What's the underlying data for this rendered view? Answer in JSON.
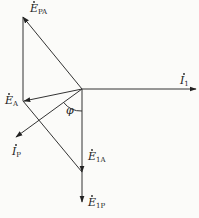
{
  "diagram": {
    "type": "phasor-diagram",
    "origin": {
      "x": 82,
      "y": 89
    },
    "colors": {
      "line": "#333333",
      "text": "#222222",
      "background": "#fbfbf9"
    },
    "vectors": [
      {
        "id": "E_PA",
        "label_main": "E",
        "label_sub": "PA",
        "dot": true,
        "from": [
          82,
          89
        ],
        "to": [
          23,
          17
        ],
        "label_pos": [
          30,
          12
        ]
      },
      {
        "id": "E_A",
        "label_main": "E",
        "label_sub": "A",
        "dot": true,
        "from": [
          82,
          89
        ],
        "to": [
          24,
          101
        ],
        "label_pos": [
          5,
          104
        ]
      },
      {
        "id": "I_1",
        "label_main": "I",
        "label_sub": "1",
        "dot": true,
        "from": [
          82,
          89
        ],
        "to": [
          196,
          89
        ],
        "label_pos": [
          180,
          84
        ]
      },
      {
        "id": "I_P",
        "label_main": "I",
        "label_sub": "P",
        "dot": true,
        "from": [
          82,
          89
        ],
        "to": [
          16,
          137
        ],
        "label_pos": [
          12,
          155
        ]
      },
      {
        "id": "E_1A",
        "label_main": "E",
        "label_sub": "1A",
        "dot": true,
        "from": [
          82,
          89
        ],
        "to": [
          82,
          172
        ],
        "label_pos": [
          88,
          160
        ]
      },
      {
        "id": "E_1P",
        "label_main": "E",
        "label_sub": "1P",
        "dot": true,
        "from": [
          82,
          172
        ],
        "to": [
          82,
          202
        ],
        "label_pos": [
          88,
          206
        ]
      }
    ],
    "construction_lines": [
      {
        "from": [
          23,
          17
        ],
        "to": [
          23,
          101
        ]
      },
      {
        "from": [
          23,
          101
        ],
        "to": [
          82,
          172
        ]
      }
    ],
    "angle": {
      "label": "φ",
      "between": [
        "I_P",
        "E_1A"
      ],
      "label_pos": [
        66,
        114
      ]
    }
  }
}
